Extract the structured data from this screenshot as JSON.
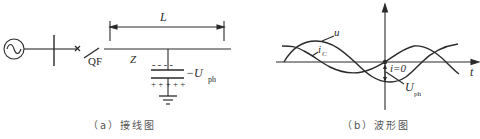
{
  "colors": {
    "ink": "#2a2a2a",
    "caption": "#555555",
    "background": "#ffffff"
  },
  "wiring_diagram": {
    "caption": "（a）接线图",
    "labels": {
      "breaker": "QF",
      "impedance": "Z",
      "length": "L",
      "voltage_main": "−U",
      "voltage_sub": "ph",
      "neg_charges": "- - - -",
      "pos_charges": "+ + + + +"
    },
    "icons": [
      "ac-generator-icon",
      "busbar",
      "breaker-x-icon",
      "switch-blade",
      "capacitor-icon",
      "ground-icon"
    ]
  },
  "waveform_diagram": {
    "caption": "（b）波形图",
    "labels": {
      "voltage_curve": "u",
      "current_curve_main": "i",
      "current_curve_sub": "C",
      "zero_current": "i=0",
      "time_axis": "t",
      "voltage_ph_main": "U",
      "voltage_ph_sub": "ph"
    }
  }
}
